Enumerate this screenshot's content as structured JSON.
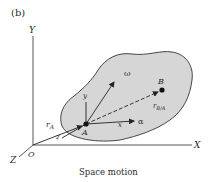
{
  "figure": {
    "panel_label": "(b)",
    "caption": "Space motion"
  },
  "axes": {
    "X": "X",
    "Y": "Y",
    "Z": "Z",
    "origin": "O"
  },
  "body": {
    "fill": "#d6d6d6",
    "stroke": "#333333",
    "points": {
      "A": "A",
      "B": "B"
    },
    "local_axes": {
      "x": "x",
      "y": "y",
      "z": "z"
    },
    "vectors": {
      "omega": "ω",
      "alpha": "α",
      "rA_main": "r",
      "rA_sub": "A",
      "rBA_main": "r",
      "rBA_sub": "B/A"
    }
  }
}
